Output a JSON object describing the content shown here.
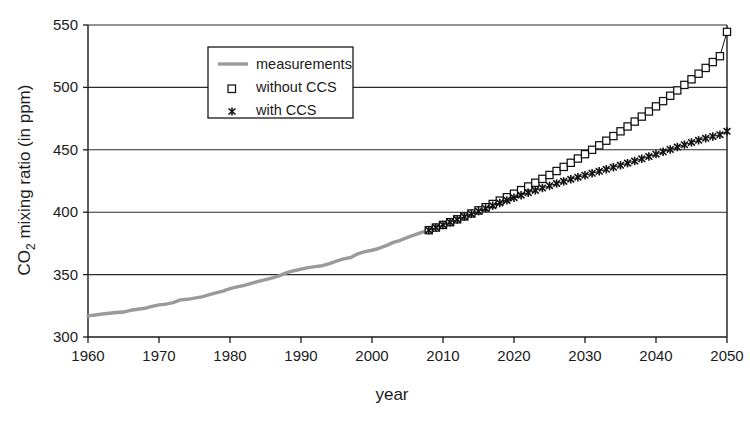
{
  "chart_data": {
    "type": "line",
    "title": "",
    "xlabel": "year",
    "ylabel": "CO2 mixing ratio (in ppm)",
    "ylabel_parts": {
      "pre": "CO",
      "sub": "2",
      "post": " mixing ratio (in ppm)"
    },
    "xlim": [
      1960,
      2050
    ],
    "ylim": [
      300,
      550
    ],
    "xticks": [
      1960,
      1970,
      1980,
      1990,
      2000,
      2010,
      2020,
      2030,
      2040,
      2050
    ],
    "yticks": [
      300,
      350,
      400,
      450,
      500,
      550
    ],
    "grid": "horizontal",
    "legend_position": "upper-left-inside",
    "series": [
      {
        "name": "measurements",
        "style": "thick-gray-line",
        "color": "#9a9a9a",
        "marker": "none",
        "x": [
          1960,
          1961,
          1962,
          1963,
          1964,
          1965,
          1966,
          1967,
          1968,
          1969,
          1970,
          1971,
          1972,
          1973,
          1974,
          1975,
          1976,
          1977,
          1978,
          1979,
          1980,
          1981,
          1982,
          1983,
          1984,
          1985,
          1986,
          1987,
          1988,
          1989,
          1990,
          1991,
          1992,
          1993,
          1994,
          1995,
          1996,
          1997,
          1998,
          1999,
          2000,
          2001,
          2002,
          2003,
          2004,
          2005,
          2006,
          2007,
          2008
        ],
        "values": [
          316.9,
          317.6,
          318.4,
          319.0,
          319.6,
          320.0,
          321.4,
          322.2,
          323.0,
          324.6,
          325.7,
          326.3,
          327.5,
          329.7,
          330.2,
          331.2,
          332.1,
          333.8,
          335.4,
          336.8,
          338.7,
          340.1,
          341.4,
          343.0,
          344.6,
          346.0,
          347.4,
          349.2,
          351.6,
          353.1,
          354.4,
          355.6,
          356.4,
          357.1,
          358.8,
          360.8,
          362.6,
          363.7,
          366.7,
          368.4,
          369.5,
          371.1,
          373.2,
          375.8,
          377.5,
          379.8,
          381.9,
          383.8,
          385.6
        ]
      },
      {
        "name": "without CCS",
        "style": "open-square-markers",
        "color": "#111111",
        "marker": "square-open",
        "x": [
          2008,
          2009,
          2010,
          2011,
          2012,
          2013,
          2014,
          2015,
          2016,
          2017,
          2018,
          2019,
          2020,
          2021,
          2022,
          2023,
          2024,
          2025,
          2026,
          2027,
          2028,
          2029,
          2030,
          2031,
          2032,
          2033,
          2034,
          2035,
          2036,
          2037,
          2038,
          2039,
          2040,
          2041,
          2042,
          2043,
          2044,
          2045,
          2046,
          2047,
          2048,
          2049,
          2050
        ],
        "values": [
          385.6,
          387.7,
          389.8,
          392.0,
          394.3,
          396.6,
          399.0,
          401.5,
          404.0,
          406.6,
          409.3,
          412.0,
          414.8,
          417.7,
          420.6,
          423.6,
          426.7,
          429.8,
          433.0,
          436.3,
          439.6,
          443.0,
          446.5,
          450.0,
          453.6,
          457.3,
          461.0,
          464.8,
          468.7,
          472.6,
          476.6,
          480.7,
          484.8,
          489.0,
          493.3,
          497.6,
          502.0,
          506.5,
          511.0,
          515.6,
          520.3,
          525.0,
          544.5
        ]
      },
      {
        "name": "with CCS",
        "style": "x-markers",
        "color": "#111111",
        "marker": "x",
        "x": [
          2008,
          2009,
          2010,
          2011,
          2012,
          2013,
          2014,
          2015,
          2016,
          2017,
          2018,
          2019,
          2020,
          2021,
          2022,
          2023,
          2024,
          2025,
          2026,
          2027,
          2028,
          2029,
          2030,
          2031,
          2032,
          2033,
          2034,
          2035,
          2036,
          2037,
          2038,
          2039,
          2040,
          2041,
          2042,
          2043,
          2044,
          2045,
          2046,
          2047,
          2048,
          2049,
          2050
        ],
        "values": [
          385.6,
          387.7,
          389.8,
          392.0,
          394.2,
          396.4,
          398.6,
          400.8,
          403.0,
          405.2,
          407.4,
          409.5,
          411.6,
          413.6,
          415.6,
          417.5,
          419.4,
          421.2,
          423.0,
          424.7,
          426.4,
          428.0,
          429.6,
          431.2,
          432.8,
          434.4,
          436.0,
          437.6,
          439.3,
          441.0,
          442.8,
          444.6,
          446.5,
          448.4,
          450.3,
          452.2,
          454.1,
          455.9,
          457.6,
          459.2,
          460.7,
          462.1,
          464.8
        ]
      }
    ]
  },
  "legend": {
    "entries": [
      {
        "label": "measurements",
        "marker": "line-gray"
      },
      {
        "label": "without CCS",
        "marker": "square-open"
      },
      {
        "label": "with CCS",
        "marker": "x"
      }
    ]
  },
  "colors": {
    "measurements": "#9a9a9a",
    "projection": "#111111",
    "axis": "#1a1a1a",
    "grid": "#2b2b2b",
    "background": "#ffffff"
  }
}
